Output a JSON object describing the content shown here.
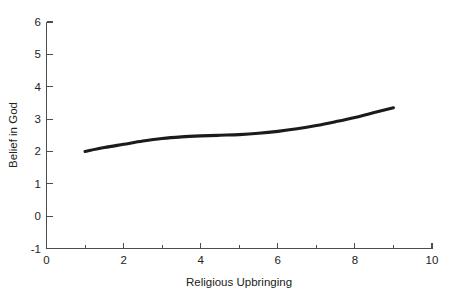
{
  "chart_data": {
    "type": "line",
    "title": "",
    "xlabel": "Religious Upbringing",
    "ylabel": "Belief in God",
    "xlim": [
      0,
      10
    ],
    "ylim": [
      -1,
      6
    ],
    "xticks": [
      0,
      2,
      4,
      6,
      8,
      10
    ],
    "xtick_labels": [
      "0",
      "2",
      "4",
      "6",
      "8",
      "10"
    ],
    "xminor_ticks": [
      1,
      3,
      5,
      7,
      9
    ],
    "yticks": [
      -1,
      0,
      1,
      2,
      3,
      4,
      5,
      6
    ],
    "ytick_labels": [
      "-1",
      "0",
      "1",
      "2",
      "3",
      "4",
      "5",
      "6"
    ],
    "grid": false,
    "legend": false,
    "line_color": "#1b1b1b",
    "axis_color": "#4d4d4d",
    "background_color": "#ffffff",
    "series": [
      {
        "name": "Belief in God",
        "x": [
          1.0,
          1.5,
          2.0,
          2.5,
          3.0,
          3.5,
          4.0,
          4.5,
          5.0,
          5.5,
          6.0,
          6.5,
          7.0,
          7.5,
          8.0,
          8.5,
          9.0
        ],
        "values": [
          2.0,
          2.12,
          2.22,
          2.32,
          2.4,
          2.45,
          2.48,
          2.5,
          2.52,
          2.56,
          2.62,
          2.7,
          2.8,
          2.92,
          3.05,
          3.2,
          3.35
        ]
      }
    ]
  },
  "axis_labels": {
    "x_title": "Religious Upbringing",
    "y_title": "Belief in God"
  }
}
